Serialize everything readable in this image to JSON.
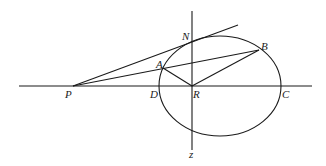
{
  "diagram": {
    "type": "geometry",
    "labels": {
      "P": "P",
      "D": "D",
      "R": "R",
      "C": "C",
      "A": "A",
      "B": "B",
      "N": "N",
      "z": "z"
    },
    "points": {
      "P": [
        73,
        86
      ],
      "D": [
        160,
        86
      ],
      "R": [
        192,
        86
      ],
      "C": [
        281,
        86
      ],
      "A": [
        163,
        68
      ],
      "B": [
        259,
        50
      ],
      "N": [
        192,
        42
      ]
    },
    "ellipse": {
      "cx": 220,
      "cy": 86,
      "rx": 61,
      "ry": 50
    },
    "axes": {
      "horizontal": {
        "x1": 19,
        "x2": 312,
        "y": 86
      },
      "vertical": {
        "x": 192,
        "y1": 11,
        "y2": 150
      }
    },
    "segments": [
      [
        "P",
        "tangent_end"
      ],
      [
        "P",
        "B"
      ],
      [
        "A",
        "R"
      ],
      [
        "B",
        "R"
      ]
    ],
    "tangent_end": [
      238,
      25
    ]
  }
}
